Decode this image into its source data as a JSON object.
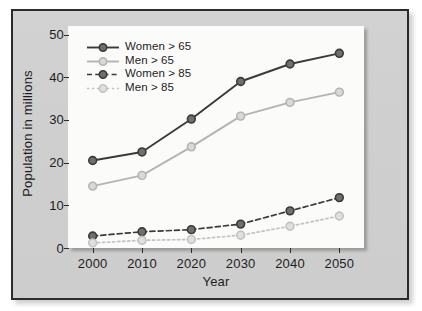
{
  "chart_data": {
    "type": "line",
    "title": "",
    "xlabel": "Year",
    "ylabel": "Population in millions",
    "x": [
      2000,
      2010,
      2020,
      2030,
      2040,
      2050
    ],
    "xtick_labels": [
      "2000",
      "2010",
      "2020",
      "2030",
      "2040",
      "2050"
    ],
    "ytick_labels": [
      "0",
      "10",
      "20",
      "30",
      "40",
      "50"
    ],
    "yticks": [
      0,
      10,
      20,
      30,
      40,
      50
    ],
    "xlim": [
      1995,
      2055
    ],
    "ylim": [
      0,
      52
    ],
    "grid": false,
    "legend_position": "upper left inside",
    "series": [
      {
        "name": "Women > 65",
        "values": [
          20.5,
          22.5,
          30.2,
          39.0,
          43.1,
          45.6
        ],
        "color": "#3a3a3a",
        "marker_fill": "#6f6f6f",
        "linestyle": "solid"
      },
      {
        "name": "Men > 65",
        "values": [
          14.5,
          17.0,
          23.7,
          30.9,
          34.1,
          36.5
        ],
        "color": "#b4b4b4",
        "marker_fill": "#d9d9d9",
        "linestyle": "solid"
      },
      {
        "name": "Women > 85",
        "values": [
          2.8,
          3.8,
          4.3,
          5.6,
          8.7,
          11.8
        ],
        "color": "#3a3a3a",
        "marker_fill": "#6f6f6f",
        "linestyle": "dashed"
      },
      {
        "name": "Men > 85",
        "values": [
          1.2,
          1.8,
          2.0,
          3.0,
          5.1,
          7.5
        ],
        "color": "#c2c2c2",
        "marker_fill": "#e0e0e0",
        "linestyle": "dotted"
      }
    ]
  },
  "colors": {
    "page_background": "#ffffff",
    "panel_background": "#cfcfcf",
    "panel_border": "#2b2b2b",
    "plot_background": "#fbfbfa",
    "axis": "#2b2b2b",
    "text": "#1d1d1d"
  }
}
